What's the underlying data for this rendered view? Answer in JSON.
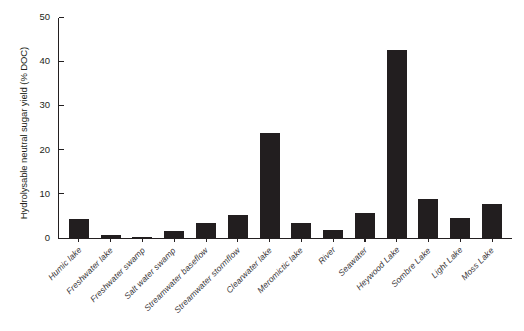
{
  "chart_data": {
    "type": "bar",
    "title": "",
    "subtitle": "",
    "xlabel": "",
    "ylabel": "Hydrolysable neutral sugar yield (% DOC)",
    "ylim": [
      0,
      50
    ],
    "yticks": [
      0,
      10,
      20,
      30,
      40,
      50
    ],
    "ytick_labels": [
      "0",
      "10",
      "20",
      "30",
      "40",
      "50"
    ],
    "grid": false,
    "legend": null,
    "bar_color": "#221e1f",
    "axis_color": "#231f20",
    "categories": [
      "Humic lake",
      "Freshwater lake",
      "Freshwater swamp",
      "Salt water swamp",
      "Streamwater baseflow",
      "Streamwater stormflow",
      "Clearwater lake",
      "Meromictic lake",
      "River",
      "Seawater",
      "Heywood Lake",
      "Sombre Lake",
      "Light Lake",
      "Moss Lake"
    ],
    "values": [
      4.2,
      0.7,
      0.2,
      1.7,
      3.3,
      5.1,
      23.8,
      3.5,
      1.8,
      5.7,
      42.6,
      8.9,
      4.6,
      7.6
    ]
  }
}
